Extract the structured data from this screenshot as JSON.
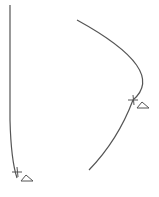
{
  "diagram": {
    "background": "#ffffff",
    "stroke_color": "#555555",
    "curves": [
      {
        "id": "left-curve",
        "description": "near-vertical line bending slightly right at bottom",
        "path": "M10 5 L10 120 Q11 160 17 178",
        "tick": {
          "x": 17,
          "y": 172,
          "size": 5
        },
        "marker": {
          "shape": "triangle",
          "x": 27,
          "y": 181,
          "width": 12,
          "height": 6,
          "label": "Δ"
        }
      },
      {
        "id": "right-curve",
        "description": "parabolic arc opening to the left",
        "path": "M77 20 Q168 70 133 100 Q118 140 89 170",
        "tick": {
          "x": 133,
          "y": 100,
          "size": 5
        },
        "marker": {
          "shape": "triangle",
          "x": 143,
          "y": 108,
          "width": 12,
          "height": 6,
          "label": "Δ"
        }
      }
    ]
  }
}
